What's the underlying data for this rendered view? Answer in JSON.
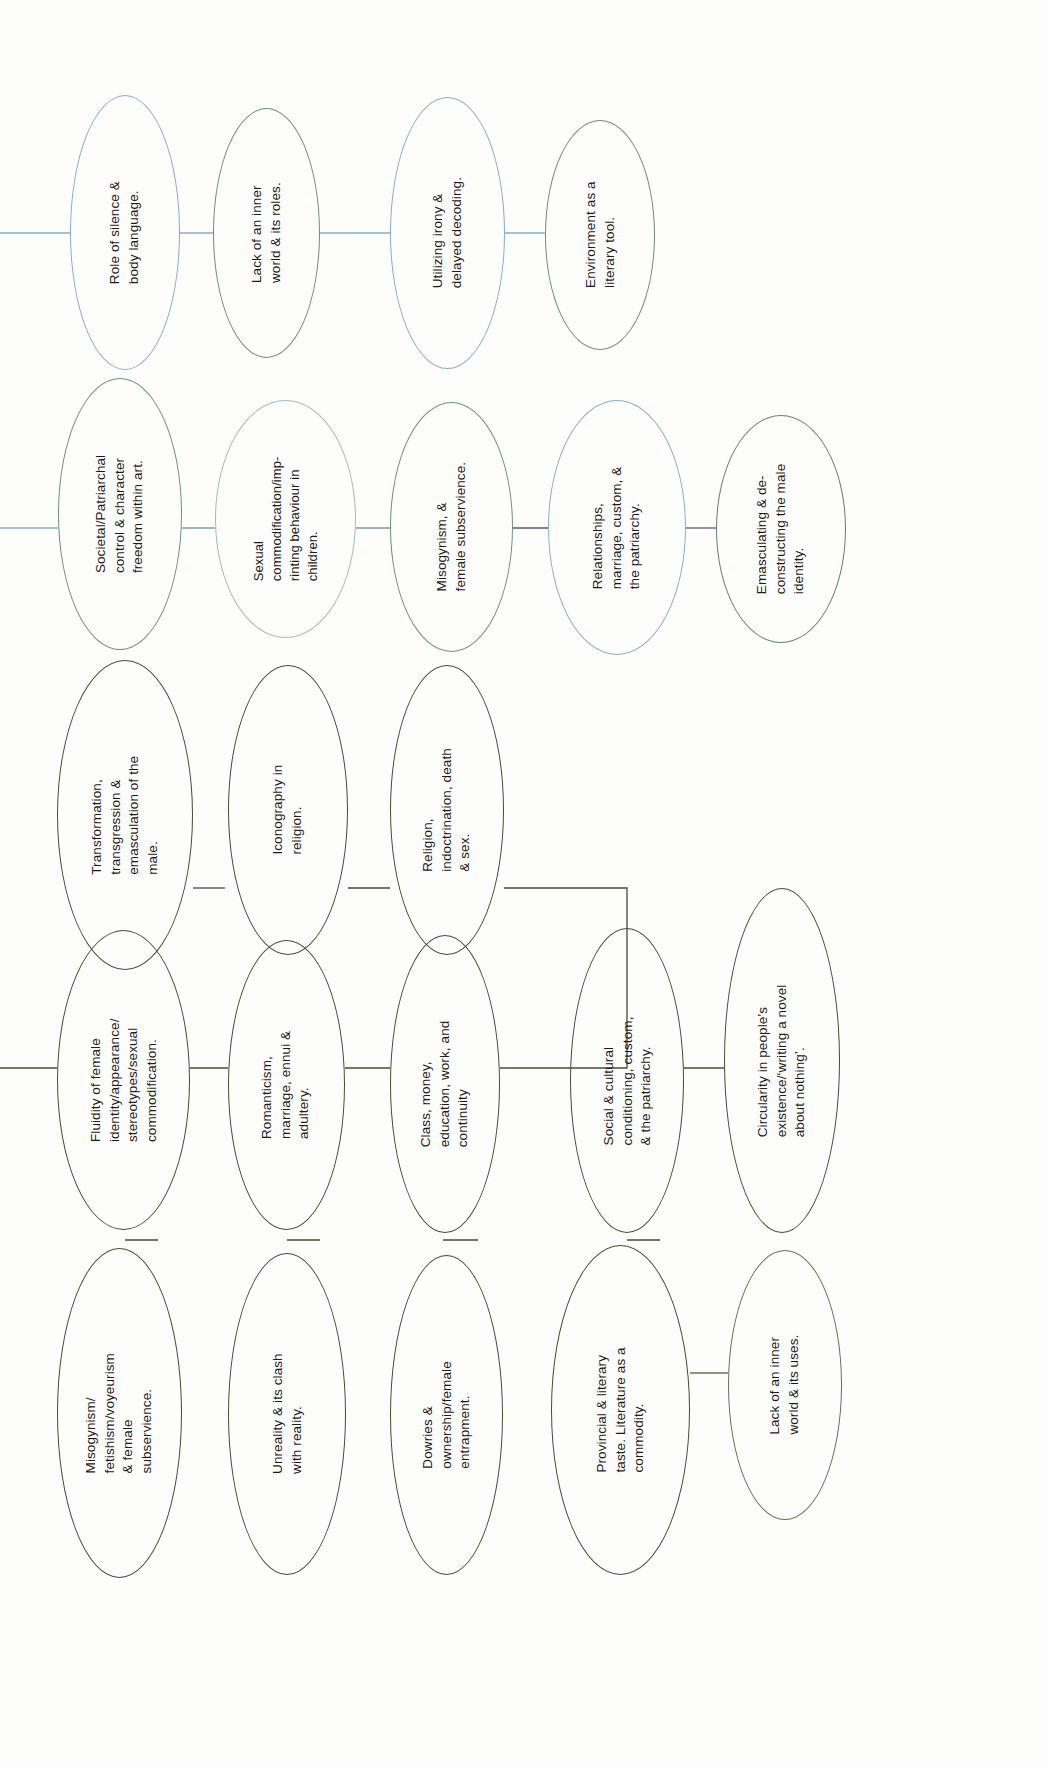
{
  "diagram": {
    "orientation": "text rotated 90 degrees counter-clockwise",
    "palette": {
      "blue": "#87aece",
      "teal": "#6d8f86",
      "pale_teal": "#9dbfbb",
      "navy": "#5d7fa6",
      "olive": "#4a4b2d",
      "light_olive": "#6e6f4e",
      "green": "#5f8273",
      "page": "#fdfdfc",
      "text": "#1b1b1b"
    },
    "nodes": [
      {
        "id": "n1",
        "text": "Role of silence &\nbody language.",
        "color": "blue"
      },
      {
        "id": "n2",
        "text": "Lack of an inner\nworld & its roles.",
        "color": "teal"
      },
      {
        "id": "n3",
        "text": "Utilizing irony &\ndelayed decoding.",
        "color": "blue"
      },
      {
        "id": "n4",
        "text": "Environment as a\nliterary tool.",
        "color": "teal"
      },
      {
        "id": "n5",
        "text": "Societal/Patriarchal\ncontrol & character\nfreedom within art.",
        "color": "teal"
      },
      {
        "id": "n6",
        "text": "Sexual\ncommodification/imp-\nrinting behaviour in\nchildren.",
        "color": "pale_teal"
      },
      {
        "id": "n7",
        "text": "Misogynism, &\nfemale subservience.",
        "color": "teal"
      },
      {
        "id": "n8",
        "text": "Relationships,\nmarriage, custom, &\nthe patriarchy.",
        "color": "blue"
      },
      {
        "id": "n9",
        "text": "Emasculating & de-\nconstructing the male\nidentity.",
        "color": "green"
      },
      {
        "id": "n10",
        "text": "Transformation,\ntransgression &\nemasculation of the\nmale.",
        "color": "olive"
      },
      {
        "id": "n11",
        "text": "Iconography in\nreligion.",
        "color": "olive"
      },
      {
        "id": "n12",
        "text": "Religion,\nindoctrination, death\n& sex.",
        "color": "olive"
      },
      {
        "id": "n13",
        "text": "Fluidity of female\nidentity/appearance/\nstereotypes/sexual\ncommodification.",
        "color": "olive"
      },
      {
        "id": "n14",
        "text": "Romanticism,\nmarriage, ennui &\nadultery.",
        "color": "olive"
      },
      {
        "id": "n15",
        "text": "Class, money,\neducation, work, and\ncontinuity",
        "color": "olive"
      },
      {
        "id": "n16",
        "text": "Social & cultural\nconditioning, custom,\n& the patriarchy.",
        "color": "olive"
      },
      {
        "id": "n17",
        "text": "Circularity in people’s\nexistence/‘writing a novel\nabout nothing’.",
        "color": "olive"
      },
      {
        "id": "n18",
        "text": "Misogynism/\nfetishism/voyeurism\n& female\nsubservience.",
        "color": "olive"
      },
      {
        "id": "n19",
        "text": "Unreality & its clash\nwith reality.",
        "color": "olive"
      },
      {
        "id": "n20",
        "text": "Dowries &\nownership/female\nentrapment.",
        "color": "olive"
      },
      {
        "id": "n21",
        "text": "Provincial & literary\ntaste. Literature as a\ncommodity.",
        "color": "olive"
      },
      {
        "id": "n22",
        "text": "Lack of an inner\nworld & its uses.",
        "color": "light_olive"
      }
    ],
    "edges": [
      {
        "from": "offscreen-left",
        "to": "n1"
      },
      {
        "from": "n1",
        "to": "n2"
      },
      {
        "from": "n2",
        "to": "n3"
      },
      {
        "from": "n3",
        "to": "n4"
      },
      {
        "from": "offscreen-left",
        "to": "n5"
      },
      {
        "from": "n5",
        "to": "n6"
      },
      {
        "from": "n6",
        "to": "n7"
      },
      {
        "from": "n7",
        "to": "n8"
      },
      {
        "from": "n8",
        "to": "n9"
      },
      {
        "from": "n10",
        "to": "n13"
      },
      {
        "from": "n11",
        "to": "n12"
      },
      {
        "from": "n12",
        "to": "n16"
      },
      {
        "from": "offscreen-left",
        "to": "n13"
      },
      {
        "from": "n13",
        "to": "n14"
      },
      {
        "from": "n14",
        "to": "n15"
      },
      {
        "from": "n15",
        "to": "n16"
      },
      {
        "from": "n16",
        "to": "n17"
      },
      {
        "from": "n13",
        "to": "n18"
      },
      {
        "from": "n14",
        "to": "n19"
      },
      {
        "from": "n15",
        "to": "n20"
      },
      {
        "from": "n16",
        "to": "n21"
      },
      {
        "from": "n21",
        "to": "n22"
      }
    ]
  }
}
